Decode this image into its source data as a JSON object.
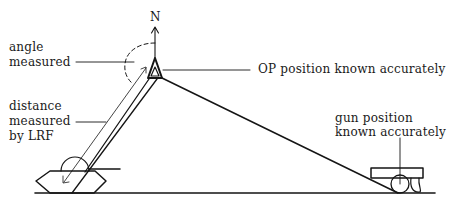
{
  "diagram": {
    "compass": {
      "label": "N"
    },
    "labels": {
      "angle": {
        "line1": "angle",
        "line2": "measured"
      },
      "op": {
        "text": "OP position known accurately"
      },
      "distance": {
        "line1": "distance",
        "line2": "measured",
        "line3": "by LRF"
      },
      "gun": {
        "line1": "gun position",
        "line2": "known accurately"
      }
    },
    "elements": [
      "north-arrow",
      "angle-arc",
      "op-triangle",
      "tank-to-op-sightline",
      "op-to-gun-line",
      "ground-line",
      "tank",
      "gun"
    ],
    "colors": {
      "ink": "#151515",
      "background": "#ffffff"
    }
  }
}
